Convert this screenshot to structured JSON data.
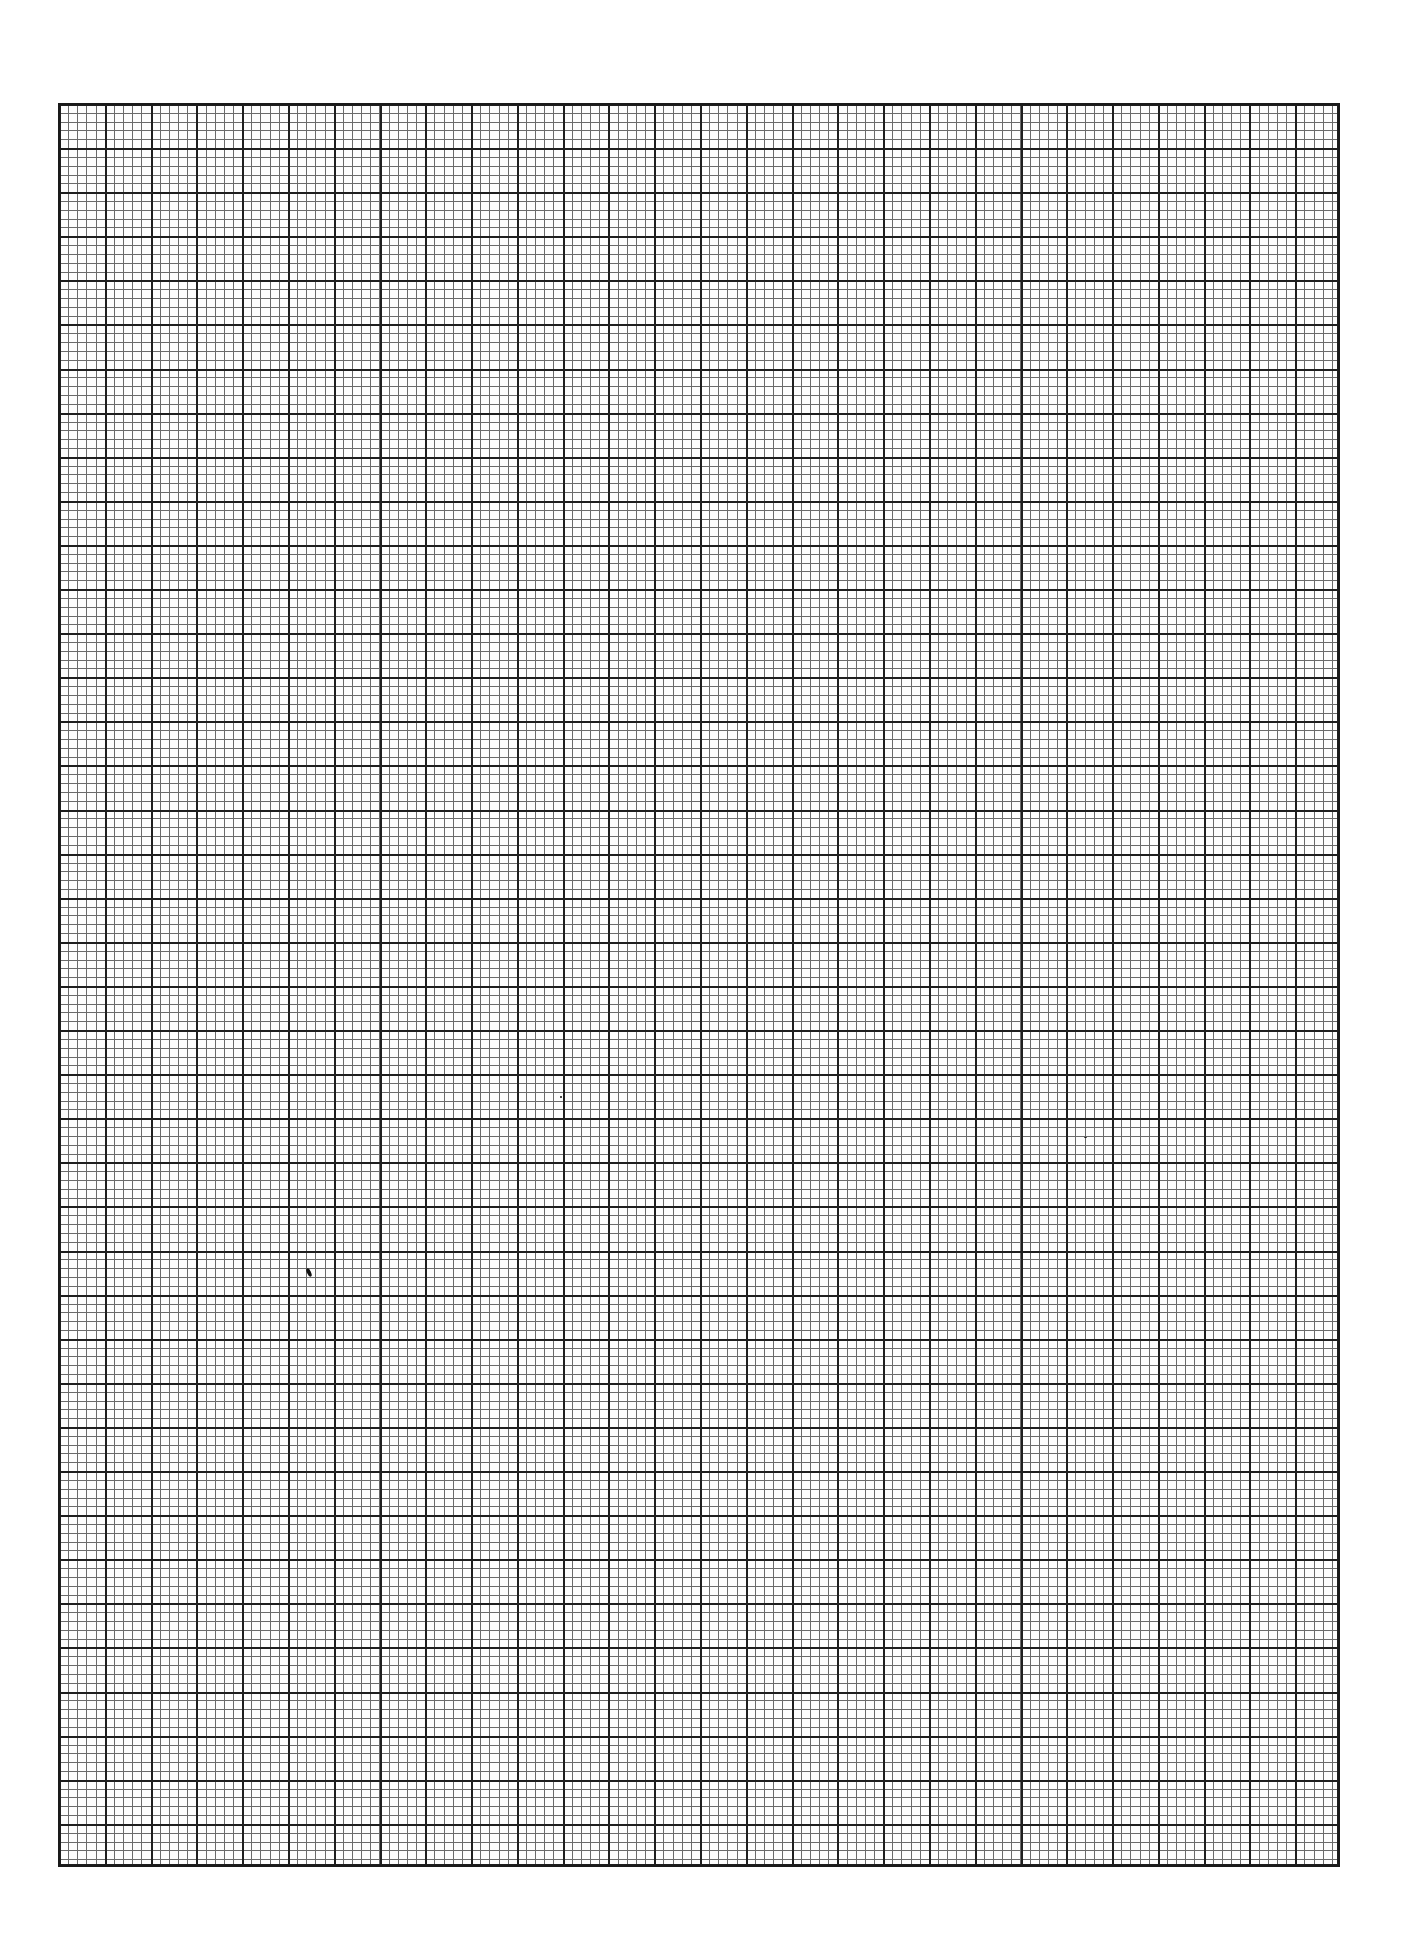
{
  "page": {
    "background": "#ffffff"
  },
  "grid": {
    "columns_major": 28,
    "rows_major": 40,
    "minor_per_major": 5,
    "major_line_color": "#1e1e1e",
    "minor_line_color": "#6a6a6a",
    "border_color": "#1a1a1a"
  },
  "marks": [
    {
      "name": "ink-speck",
      "x": 309,
      "y": 1272
    },
    {
      "name": "dot-mark",
      "x": 561,
      "y": 1097
    },
    {
      "name": "dash-mark",
      "x": 1085,
      "y": 1137
    }
  ]
}
